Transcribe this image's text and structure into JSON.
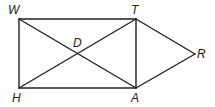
{
  "diagram": {
    "points": {
      "W": {
        "label": "W",
        "x": 19,
        "y": 19,
        "lx": 8,
        "ly": 4
      },
      "T": {
        "label": "T",
        "x": 136,
        "y": 19,
        "lx": 131,
        "ly": 4
      },
      "H": {
        "label": "H",
        "x": 19,
        "y": 88,
        "lx": 12,
        "ly": 92
      },
      "A": {
        "label": "A",
        "x": 136,
        "y": 88,
        "lx": 131,
        "ly": 92
      },
      "R": {
        "label": "R",
        "x": 195,
        "y": 54,
        "lx": 196,
        "ly": 48
      },
      "D": {
        "label": "D",
        "x": 78,
        "y": 54,
        "lx": 72,
        "ly": 37
      }
    },
    "segments": [
      "WT",
      "TA",
      "AH",
      "HW",
      "WA",
      "HT",
      "TR",
      "RA"
    ],
    "stroke_color": "#222222"
  }
}
